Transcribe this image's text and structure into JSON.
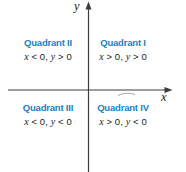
{
  "figure": {
    "type": "cartesian-quadrants-diagram",
    "y_axis_label": "y",
    "x_axis_label": "x",
    "quadrants": [
      {
        "name": "Quadrant II",
        "condition": "x < 0, y > 0",
        "position": "top-left"
      },
      {
        "name": "Quadrant I",
        "condition": "x > 0, y > 0",
        "position": "top-right"
      },
      {
        "name": "Quadrant III",
        "condition": "x < 0, y < 0",
        "position": "bottom-left"
      },
      {
        "name": "Quadrant IV",
        "condition": "x > 0, y < 0",
        "position": "bottom-right"
      }
    ],
    "colors": {
      "quadrant_name": "#1d7fc1",
      "condition_text": "#1c1c1c",
      "axis": "#3c3c3c",
      "background": "#ffffff"
    }
  }
}
